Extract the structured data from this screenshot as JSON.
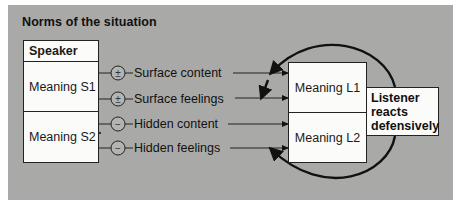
{
  "title": "Norms of the situation",
  "speaker": {
    "header": "Speaker",
    "meaning_1": "Meaning S1",
    "meaning_2": "Meaning S2"
  },
  "channels": [
    {
      "symbol": "±",
      "label": "Surface content"
    },
    {
      "symbol": "±",
      "label": "Surface feelings"
    },
    {
      "symbol": "−",
      "label": "Hidden content"
    },
    {
      "symbol": "−",
      "label": "Hidden feelings"
    }
  ],
  "listener": {
    "meaning_1": "Meaning L1",
    "meaning_2": "Meaning L2"
  },
  "reaction": {
    "line_1": "Listener",
    "line_2": "reacts",
    "line_3": "defensively"
  },
  "colors": {
    "background": "#a9a9a7",
    "box_fill": "#fbfbfa",
    "ink": "#111111"
  }
}
